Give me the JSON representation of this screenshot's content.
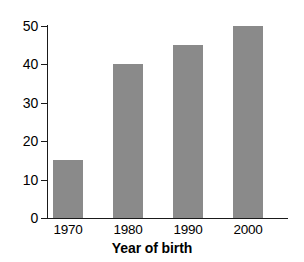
{
  "chart_data": {
    "type": "bar",
    "title": "",
    "xlabel": "Year of birth",
    "ylabel": "",
    "categories": [
      "1970",
      "1980",
      "1990",
      "2000"
    ],
    "values": [
      15,
      40,
      45,
      50
    ],
    "ylim": [
      0,
      50
    ],
    "yticks": [
      0,
      10,
      20,
      30,
      40,
      50
    ],
    "ytick_labels": [
      "0",
      "10",
      "20",
      "30",
      "40",
      "50"
    ],
    "xtick_labels": [
      "1970",
      "1980",
      "1990",
      "2000"
    ],
    "grid": false,
    "legend": null,
    "bar_color": "#8a8a8a",
    "axis_color": "#1a1a1a",
    "background_color": "#ffffff"
  },
  "axis": {
    "x_title": "Year of birth"
  },
  "yticks": [
    {
      "label": "50",
      "value": 50
    },
    {
      "label": "40",
      "value": 40
    },
    {
      "label": "30",
      "value": 30
    },
    {
      "label": "20",
      "value": 20
    },
    {
      "label": "10",
      "value": 10
    },
    {
      "label": "0",
      "value": 0
    }
  ],
  "bars": [
    {
      "category": "1970",
      "value": 15
    },
    {
      "category": "1980",
      "value": 40
    },
    {
      "category": "1990",
      "value": 45
    },
    {
      "category": "2000",
      "value": 50
    }
  ]
}
